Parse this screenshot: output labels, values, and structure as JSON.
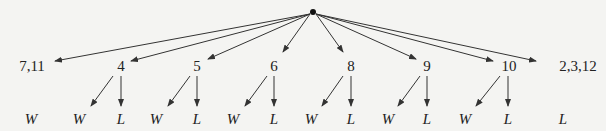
{
  "diagram": {
    "root": {
      "x": 313,
      "y": 12
    },
    "level1": [
      {
        "label": "7,11",
        "x": 32,
        "y": 66,
        "tip": [
          55,
          61
        ]
      },
      {
        "label": "4",
        "x": 121,
        "y": 66,
        "tip": [
          131,
          61
        ]
      },
      {
        "label": "5",
        "x": 197,
        "y": 66,
        "tip": [
          208,
          59
        ]
      },
      {
        "label": "6",
        "x": 274,
        "y": 66,
        "tip": [
          283,
          52
        ]
      },
      {
        "label": "8",
        "x": 351,
        "y": 66,
        "tip": [
          343,
          52
        ]
      },
      {
        "label": "9",
        "x": 427,
        "y": 66,
        "tip": [
          416,
          59
        ]
      },
      {
        "label": "10",
        "x": 509,
        "y": 66,
        "tip": [
          493,
          61
        ]
      },
      {
        "label": "2,3,12",
        "x": 578,
        "y": 66,
        "tip": [
          536,
          61
        ]
      }
    ],
    "outcomes": [
      {
        "label": "W",
        "x": 31,
        "y": 119,
        "from": null
      },
      {
        "label": "W",
        "x": 79,
        "y": 119,
        "from": [
          113,
          76
        ],
        "tip": [
          91,
          106
        ]
      },
      {
        "label": "L",
        "x": 121,
        "y": 119,
        "from": [
          121,
          76
        ],
        "tip": [
          121,
          106
        ]
      },
      {
        "label": "W",
        "x": 156,
        "y": 119,
        "from": [
          190,
          76
        ],
        "tip": [
          168,
          106
        ]
      },
      {
        "label": "L",
        "x": 197,
        "y": 119,
        "from": [
          197,
          76
        ],
        "tip": [
          197,
          106
        ]
      },
      {
        "label": "W",
        "x": 233,
        "y": 119,
        "from": [
          267,
          76
        ],
        "tip": [
          245,
          106
        ]
      },
      {
        "label": "L",
        "x": 274,
        "y": 119,
        "from": [
          274,
          76
        ],
        "tip": [
          274,
          106
        ]
      },
      {
        "label": "W",
        "x": 311,
        "y": 119,
        "from": [
          343,
          76
        ],
        "tip": [
          322,
          106
        ]
      },
      {
        "label": "L",
        "x": 351,
        "y": 119,
        "from": [
          351,
          76
        ],
        "tip": [
          351,
          106
        ]
      },
      {
        "label": "W",
        "x": 388,
        "y": 119,
        "from": [
          420,
          76
        ],
        "tip": [
          398,
          106
        ]
      },
      {
        "label": "L",
        "x": 427,
        "y": 119,
        "from": [
          427,
          76
        ],
        "tip": [
          427,
          106
        ]
      },
      {
        "label": "W",
        "x": 465,
        "y": 119,
        "from": [
          500,
          76
        ],
        "tip": [
          476,
          106
        ]
      },
      {
        "label": "L",
        "x": 508,
        "y": 119,
        "from": [
          508,
          76
        ],
        "tip": [
          508,
          106
        ]
      },
      {
        "label": "L",
        "x": 563,
        "y": 119,
        "from": null
      }
    ]
  }
}
